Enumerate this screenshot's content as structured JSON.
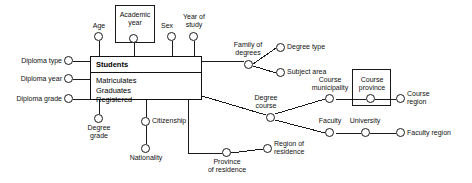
{
  "diagram": {
    "fact": {
      "name": "Students",
      "measures": [
        "Matriculates",
        "Graduates",
        "Registered"
      ]
    },
    "dimension_labels": {
      "age": "Age",
      "academic_year": "Academic\nyear",
      "sex": "Sex",
      "year_of_study": "Year of\nstudy",
      "diploma_type": "Diploma type",
      "diploma_year": "Diploma year",
      "diploma_grade": "Diploma grade",
      "degree_grade": "Degree\ngrade",
      "citizenship": "Citizenship",
      "nationality": "Nationality",
      "family_of_degrees": "Family of\ndegrees",
      "degree_type": "Degree type",
      "subject_area": "Subject area",
      "degree_course": "Degree\ncourse",
      "course_municipality": "Course\nmunicipality",
      "course_province": "Course\nprovince",
      "course_region": "Course\nregion",
      "faculty": "Faculty",
      "university": "University",
      "faculty_region": "Faculty region",
      "province_of_residence": "Province\nof residence",
      "region_of_residence": "Region of\nresidence"
    },
    "grouping_boxes": [
      "Academic year",
      "Course province"
    ],
    "colors": {
      "line": "#1a1a1a",
      "text": "#111111",
      "background": "#ffffff"
    }
  }
}
